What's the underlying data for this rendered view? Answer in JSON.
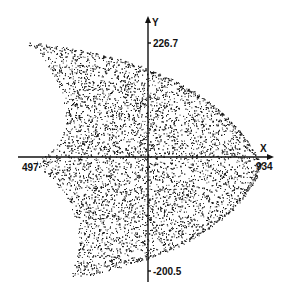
{
  "chart_data": {
    "type": "scatter",
    "title": "",
    "xlabel": "X",
    "ylabel": "Y",
    "xlim": [
      497,
      934
    ],
    "ylim": [
      -200.5,
      226.7
    ],
    "x_tick_labels": [
      "497",
      "934"
    ],
    "y_tick_labels": [
      "226.7",
      "-200.5"
    ],
    "grid": false,
    "legend": null,
    "point_color": "#111111",
    "approx_point_count": 9000,
    "region_outline_data_units": {
      "top_cusp": [
        486,
        225
      ],
      "left_cusp": [
        490,
        2
      ],
      "bottom_cusp": [
        555,
        -220
      ],
      "right_apex": [
        934,
        0
      ],
      "upper_inner_curve_deepest": [
        551,
        90
      ],
      "lower_inner_curve_deepest": [
        570,
        -105
      ]
    }
  }
}
